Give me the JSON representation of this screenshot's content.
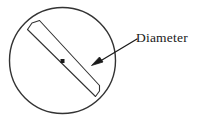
{
  "figure": {
    "type": "geometry-diagram",
    "background_color": "#ffffff",
    "stroke_color": "#333333",
    "text_color": "#1a1a1a"
  },
  "circle": {
    "name": "circle",
    "center_x": 62.5,
    "center_y": 60.5,
    "radius": 53,
    "stroke_width": 1.4,
    "fill": "none"
  },
  "center_point": {
    "name": "center-dot",
    "x": 62.5,
    "y": 61,
    "size": 4,
    "fill": "#1a1a1a"
  },
  "diameter_band": {
    "name": "diameter-band",
    "description": "narrow rectangular strip drawn across the circle through its center",
    "angle_degrees": 40,
    "band_width": 17,
    "stroke_width": 1.1,
    "end_cap_top_left": [
      28,
      30
    ],
    "end_cap_bottom_right": [
      98,
      94
    ],
    "edge1": "M 27.5 29.5 L 95.5 96.5",
    "edge2": "M 39.5 20.5 L 99.5 85.5",
    "cap_top": "M 27.5 29.5 L 33.5 23.5 L 39.5 20.5",
    "cap_bottom": "M 95.5 96.5 L 99.0 90.5 L 99.5 85.5"
  },
  "arrow": {
    "name": "pointer-arrow",
    "tail_x": 137,
    "tail_y": 39,
    "tip_x": 92,
    "tip_y": 65,
    "stroke_width": 1.3,
    "head_length": 10,
    "head_width": 7
  },
  "labels": {
    "diameter": {
      "name": "diameter-label",
      "text": "Diameter",
      "x": 136,
      "y": 42,
      "font_size": 13.5,
      "anchor": "start"
    }
  }
}
